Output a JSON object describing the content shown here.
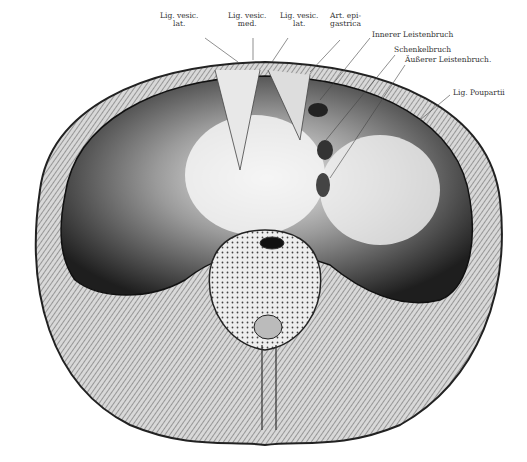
{
  "figure": {
    "labels": [
      {
        "id": "lig-vesic-lat-1",
        "line1": "Lig. vesic.",
        "line2": "lat."
      },
      {
        "id": "lig-vesic-med",
        "line1": "Lig. vesic.",
        "line2": "med."
      },
      {
        "id": "lig-vesic-lat-2",
        "line1": "Lig. vesic.",
        "line2": "lat."
      },
      {
        "id": "art-epigastrica",
        "line1": "Art. epi-",
        "line2": "gastrica"
      },
      {
        "id": "innerer-leistenbruch",
        "line1": "Innerer Leistenbruch"
      },
      {
        "id": "schenkelbruch",
        "line1": "Schenkelbruch"
      },
      {
        "id": "aeusserer-leistenbruch",
        "line1": "Äußerer Leistenbruch."
      },
      {
        "id": "lig-poupartii",
        "line1": "Lig. Poupartii"
      }
    ]
  }
}
